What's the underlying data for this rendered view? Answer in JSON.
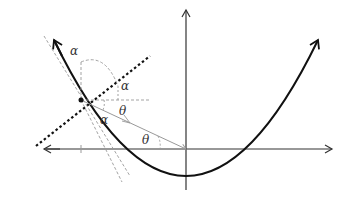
{
  "diagram": {
    "labels": {
      "alpha_top": "α",
      "alpha_right": "α",
      "alpha_lower": "α",
      "theta_upper": "θ",
      "theta_lower": "θ"
    },
    "colors": {
      "curve": "#111111",
      "axes": "#333333",
      "guides": "#999999",
      "tangent": "#111111"
    }
  }
}
